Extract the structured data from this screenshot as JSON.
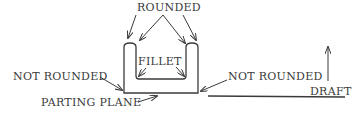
{
  "diagram": {
    "type": "casting-cross-section",
    "colors": {
      "ink": "#3a3a3a",
      "background": "#ffffff"
    },
    "labels": {
      "rounded": "ROUNDED",
      "fillet": "FILLET",
      "not_rounded_left": "NOT ROUNDED",
      "not_rounded_right": "NOT ROUNDED",
      "parting_plane": "PARTING PLANE",
      "draft": "DRAFT"
    }
  }
}
